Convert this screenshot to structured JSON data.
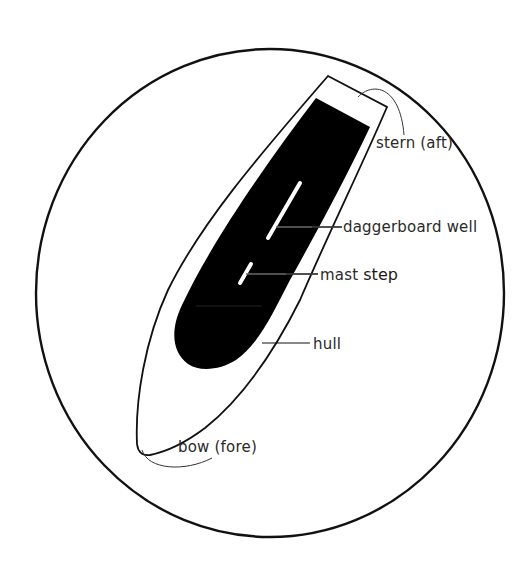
{
  "diagram": {
    "colors": {
      "background": "#ffffff",
      "stroke": "#111111",
      "fill_dark": "#000000",
      "slot": "#ffffff",
      "label": "#2a2a2a"
    },
    "labels": {
      "stern": "stern (aft)",
      "daggerboard": "daggerboard well",
      "mast_prefix": "mast ",
      "mast_suffix": "step",
      "hull": "hull",
      "bow": "bow (fore)"
    }
  }
}
